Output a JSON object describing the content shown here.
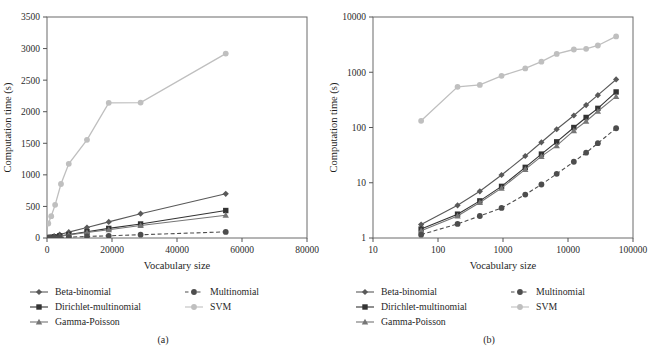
{
  "figure": {
    "width": 652,
    "height": 353,
    "background": "#ffffff"
  },
  "common": {
    "xlabel": "Vocabulary size",
    "ylabel": "Computation time (s)",
    "series_names": [
      "Beta-binomial",
      "Dirichlet-multinomial",
      "Gamma-Poisson",
      "Multinomial",
      "SVM"
    ],
    "colors": {
      "beta_binomial": "#595959",
      "dirichlet_multinomial": "#333333",
      "gamma_poisson": "#767676",
      "multinomial": "#4d4d4d",
      "svm": "#bfbfbf"
    },
    "markers": {
      "beta_binomial": "diamond",
      "dirichlet_multinomial": "square",
      "gamma_poisson": "triangle",
      "multinomial": "circle",
      "svm": "circle"
    },
    "dashes": {
      "beta_binomial": "solid",
      "dirichlet_multinomial": "solid",
      "gamma_poisson": "solid",
      "multinomial": "dashed",
      "svm": "solid"
    }
  },
  "legend": {
    "column1": [
      "Beta-binomial",
      "Dirichlet-multinomial",
      "Gamma-Poisson"
    ],
    "column2": [
      "Multinomial",
      "SVM"
    ],
    "keys1": [
      "beta_binomial",
      "dirichlet_multinomial",
      "gamma_poisson"
    ],
    "keys2": [
      "multinomial",
      "svm"
    ]
  },
  "panel_a": {
    "caption": "(a)",
    "chart_data": {
      "type": "line",
      "title": "",
      "xlabel": "Vocabulary size",
      "ylabel": "Computation time (s)",
      "xscale": "linear",
      "yscale": "linear",
      "xlim": [
        0,
        80000
      ],
      "ylim": [
        0,
        3500
      ],
      "xticks": [
        0,
        20000,
        40000,
        60000,
        80000
      ],
      "xticklabels": [
        "0",
        "20000",
        "40000",
        "60000",
        "80000"
      ],
      "yticks": [
        0,
        500,
        1000,
        1500,
        2000,
        2500,
        3000,
        3500
      ],
      "yticklabels": [
        "0",
        "500",
        "1000",
        "1500",
        "2000",
        "2500",
        "3000",
        "3500"
      ],
      "grid": false,
      "legend_position": "below",
      "x": [
        55,
        200,
        440,
        950,
        2200,
        3900,
        6700,
        12300,
        19000,
        28800,
        55000
      ],
      "series": [
        {
          "name": "Beta-binomial",
          "key": "beta_binomial",
          "values": [
            1.7,
            3.9,
            7.0,
            13.8,
            30.5,
            54,
            93,
            165,
            255,
            385,
            700
          ]
        },
        {
          "name": "Dirichlet-multinomial",
          "key": "dirichlet_multinomial",
          "values": [
            1.5,
            2.7,
            4.7,
            8.6,
            19.0,
            33,
            55,
            100,
            152,
            222,
            435
          ]
        },
        {
          "name": "Gamma-Poisson",
          "key": "gamma_poisson",
          "values": [
            1.4,
            2.5,
            4.4,
            8.0,
            17.5,
            30,
            47,
            88,
            130,
            197,
            360
          ]
        },
        {
          "name": "Multinomial",
          "key": "multinomial",
          "values": [
            1.2,
            1.8,
            2.5,
            3.5,
            6.1,
            9.3,
            14.5,
            24.0,
            35.0,
            52.0,
            97.0
          ]
        },
        {
          "name": "SVM",
          "key": "svm",
          "values": [
            132,
            545,
            590,
            860,
            1175,
            1555,
            2150,
            2580,
            2650,
            3050,
            2920
          ]
        }
      ],
      "svm_x": [
        55,
        200,
        440,
        950,
        2200,
        3900,
        6700,
        12300,
        19000,
        28800,
        55000
      ],
      "svm_a_x": [
        400,
        1300,
        2500,
        4300,
        6700,
        12300,
        19000,
        28800,
        55000
      ],
      "svm_a_values": [
        230,
        345,
        525,
        855,
        1175,
        1555,
        2140,
        2145,
        2920
      ]
    }
  },
  "panel_b": {
    "caption": "(b)",
    "chart_data": {
      "type": "line",
      "title": "",
      "xlabel": "Vocabulary size",
      "ylabel": "Computation time (s)",
      "xscale": "log",
      "yscale": "log",
      "xlim": [
        10,
        100000
      ],
      "ylim": [
        1,
        10000
      ],
      "xticks": [
        10,
        100,
        1000,
        10000,
        100000
      ],
      "xticklabels": [
        "10",
        "100",
        "1000",
        "10000",
        "100000"
      ],
      "yticks": [
        1,
        10,
        100,
        1000,
        10000
      ],
      "yticklabels": [
        "1",
        "10",
        "100",
        "1000",
        "10000"
      ],
      "grid": false,
      "legend_position": "below",
      "x": [
        55,
        200,
        440,
        950,
        2200,
        3900,
        6700,
        12300,
        19000,
        28800,
        55000
      ],
      "series": [
        {
          "name": "Beta-binomial",
          "key": "beta_binomial",
          "values": [
            1.75,
            3.9,
            7.0,
            13.8,
            30.5,
            54,
            93,
            165,
            255,
            385,
            740
          ]
        },
        {
          "name": "Dirichlet-multinomial",
          "key": "dirichlet_multinomial",
          "values": [
            1.45,
            2.7,
            4.7,
            8.6,
            19.0,
            33,
            55,
            100,
            152,
            222,
            440
          ]
        },
        {
          "name": "Gamma-Poisson",
          "key": "gamma_poisson",
          "values": [
            1.35,
            2.5,
            4.4,
            8.0,
            17.5,
            30,
            47,
            88,
            130,
            197,
            365
          ]
        },
        {
          "name": "Multinomial",
          "key": "multinomial",
          "values": [
            1.15,
            1.8,
            2.5,
            3.5,
            6.1,
            9.3,
            14.5,
            24.0,
            35.0,
            52.0,
            97.0
          ]
        },
        {
          "name": "SVM",
          "key": "svm",
          "values": [
            132,
            545,
            590,
            860,
            1175,
            1555,
            2150,
            2580,
            2650,
            3050,
            4450
          ]
        }
      ]
    }
  }
}
